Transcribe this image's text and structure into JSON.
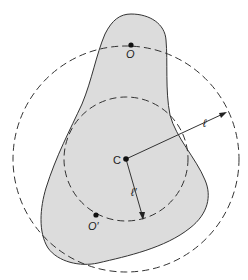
{
  "diagram": {
    "type": "geometry",
    "points": [
      {
        "id": "O",
        "label": "O"
      },
      {
        "id": "C",
        "label": "C"
      },
      {
        "id": "Oprime",
        "label": "O′"
      }
    ],
    "radii": [
      {
        "id": "outer",
        "label": "ℓ"
      },
      {
        "id": "inner",
        "label": "ℓ′"
      }
    ],
    "colors": {
      "body_fill": "#dcdcdc",
      "stroke": "#333333",
      "background": "#ffffff"
    }
  }
}
